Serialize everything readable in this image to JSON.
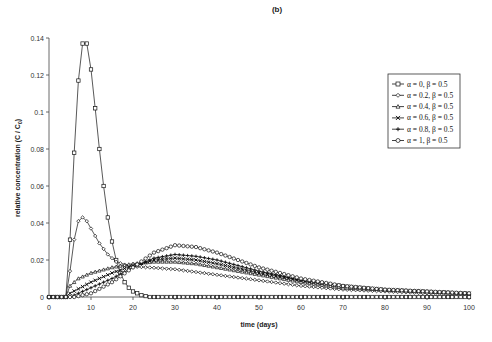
{
  "chart_data": {
    "type": "line",
    "panel_label": "(b)",
    "title": "",
    "xlabel": "time (days)",
    "ylabel": "relative concentration (C / C",
    "ylabel_subscript": "0",
    "ylabel_close": ")",
    "xlim": [
      0,
      100
    ],
    "ylim": [
      0,
      0.14
    ],
    "xticks": [
      0,
      10,
      20,
      30,
      40,
      50,
      60,
      70,
      80,
      90,
      100
    ],
    "xtick_labels": [
      "0",
      "10",
      "20",
      "30",
      "40",
      "50",
      "60",
      "70",
      "80",
      "90",
      "100"
    ],
    "yticks": [
      0,
      0.02,
      0.04,
      0.06,
      0.08,
      0.1,
      0.12,
      0.14
    ],
    "ytick_labels": [
      "0",
      "0.02",
      "0.04",
      "0.06",
      "0.08",
      "0.1",
      "0.12",
      "0.14"
    ],
    "grid": false,
    "legend_position": "top-right",
    "marker_step_days": 1,
    "series": [
      {
        "name": "α = 0, β = 0.5",
        "marker": "square",
        "points": [
          [
            0,
            0
          ],
          [
            4,
            0
          ],
          [
            5,
            0.031
          ],
          [
            6,
            0.078
          ],
          [
            7,
            0.117
          ],
          [
            8,
            0.137
          ],
          [
            9,
            0.137
          ],
          [
            10,
            0.123
          ],
          [
            11,
            0.102
          ],
          [
            12,
            0.08
          ],
          [
            13,
            0.06
          ],
          [
            14,
            0.043
          ],
          [
            15,
            0.03
          ],
          [
            16,
            0.02
          ],
          [
            17,
            0.013
          ],
          [
            18,
            0.008
          ],
          [
            19,
            0.005
          ],
          [
            20,
            0.003
          ],
          [
            21,
            0.002
          ],
          [
            22,
            0.001
          ],
          [
            24,
            0
          ],
          [
            100,
            0
          ]
        ]
      },
      {
        "name": "α = 0.2, β = 0.5",
        "marker": "diamond",
        "points": [
          [
            0,
            0
          ],
          [
            4,
            0
          ],
          [
            5,
            0.014
          ],
          [
            6,
            0.031
          ],
          [
            7,
            0.041
          ],
          [
            8,
            0.043
          ],
          [
            9,
            0.041
          ],
          [
            10,
            0.037
          ],
          [
            11,
            0.033
          ],
          [
            12,
            0.029
          ],
          [
            13,
            0.026
          ],
          [
            14,
            0.023
          ],
          [
            15,
            0.021
          ],
          [
            16,
            0.019
          ],
          [
            18,
            0.0175
          ],
          [
            20,
            0.0165
          ],
          [
            25,
            0.0158
          ],
          [
            30,
            0.015
          ],
          [
            40,
            0.012
          ],
          [
            50,
            0.009
          ],
          [
            60,
            0.006
          ],
          [
            70,
            0.004
          ],
          [
            80,
            0.003
          ],
          [
            90,
            0.002
          ],
          [
            100,
            0.0015
          ]
        ]
      },
      {
        "name": "α = 0.4, β = 0.5",
        "marker": "triangle",
        "points": [
          [
            0,
            0
          ],
          [
            4,
            0
          ],
          [
            5,
            0.006
          ],
          [
            7,
            0.01
          ],
          [
            10,
            0.013
          ],
          [
            15,
            0.016
          ],
          [
            20,
            0.018
          ],
          [
            25,
            0.019
          ],
          [
            30,
            0.019
          ],
          [
            35,
            0.018
          ],
          [
            40,
            0.016
          ],
          [
            50,
            0.012
          ],
          [
            60,
            0.008
          ],
          [
            70,
            0.005
          ],
          [
            80,
            0.004
          ],
          [
            90,
            0.003
          ],
          [
            100,
            0.002
          ]
        ]
      },
      {
        "name": "α = 0.6, β = 0.5",
        "marker": "x",
        "points": [
          [
            0,
            0
          ],
          [
            4,
            0
          ],
          [
            5,
            0.002
          ],
          [
            10,
            0.008
          ],
          [
            15,
            0.013
          ],
          [
            20,
            0.017
          ],
          [
            25,
            0.02
          ],
          [
            30,
            0.021
          ],
          [
            35,
            0.02
          ],
          [
            40,
            0.018
          ],
          [
            50,
            0.013
          ],
          [
            60,
            0.009
          ],
          [
            70,
            0.006
          ],
          [
            80,
            0.004
          ],
          [
            90,
            0.003
          ],
          [
            100,
            0.002
          ]
        ]
      },
      {
        "name": "α = 0.8, β = 0.5",
        "marker": "plus",
        "points": [
          [
            0,
            0
          ],
          [
            5,
            0
          ],
          [
            10,
            0.005
          ],
          [
            15,
            0.01
          ],
          [
            20,
            0.016
          ],
          [
            25,
            0.021
          ],
          [
            30,
            0.023
          ],
          [
            35,
            0.022
          ],
          [
            40,
            0.02
          ],
          [
            50,
            0.014
          ],
          [
            60,
            0.009
          ],
          [
            70,
            0.006
          ],
          [
            80,
            0.004
          ],
          [
            90,
            0.003
          ],
          [
            100,
            0.002
          ]
        ]
      },
      {
        "name": "α = 1, β = 0.5",
        "marker": "circle",
        "points": [
          [
            0,
            0
          ],
          [
            6,
            0
          ],
          [
            10,
            0.002
          ],
          [
            15,
            0.008
          ],
          [
            20,
            0.016
          ],
          [
            25,
            0.024
          ],
          [
            30,
            0.028
          ],
          [
            35,
            0.027
          ],
          [
            40,
            0.024
          ],
          [
            50,
            0.016
          ],
          [
            60,
            0.01
          ],
          [
            70,
            0.006
          ],
          [
            80,
            0.004
          ],
          [
            90,
            0.003
          ],
          [
            100,
            0.002
          ]
        ]
      }
    ]
  }
}
